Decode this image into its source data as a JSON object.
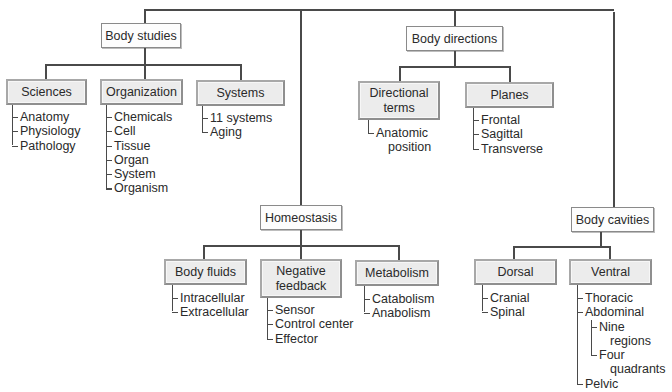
{
  "diagram": {
    "categories": [
      {
        "label": "Body studies",
        "children": [
          {
            "label": "Sciences",
            "items": [
              "Anatomy",
              "Physiology",
              "Pathology"
            ]
          },
          {
            "label": "Organization",
            "items": [
              "Chemicals",
              "Cell",
              "Tissue",
              "Organ",
              "System",
              "Organism"
            ]
          },
          {
            "label": "Systems",
            "items": [
              "11 systems",
              "Aging"
            ]
          }
        ]
      },
      {
        "label": "Homeostasis",
        "children": [
          {
            "label": "Body fluids",
            "items": [
              "Intracellular",
              "Extracellular"
            ]
          },
          {
            "label_line1": "Negative",
            "label_line2": "feedback",
            "items": [
              "Sensor",
              "Control center",
              "Effector"
            ]
          },
          {
            "label": "Metabolism",
            "items": [
              "Catabolism",
              "Anabolism"
            ]
          }
        ]
      },
      {
        "label": "Body directions",
        "children": [
          {
            "label_line1": "Directional",
            "label_line2": "terms",
            "items": [
              {
                "line1": "Anatomic",
                "line2": "position"
              }
            ]
          },
          {
            "label": "Planes",
            "items": [
              "Frontal",
              "Sagittal",
              "Transverse"
            ]
          }
        ]
      },
      {
        "label": "Body cavities",
        "children": [
          {
            "label": "Dorsal",
            "items": [
              "Cranial",
              "Spinal"
            ]
          },
          {
            "label": "Ventral",
            "items": [
              "Thoracic",
              "Abdominal",
              {
                "line1": "Nine",
                "line2": "regions"
              },
              {
                "line1": "Four",
                "line2": "quadrants"
              },
              "Pelvic"
            ]
          }
        ]
      }
    ]
  }
}
